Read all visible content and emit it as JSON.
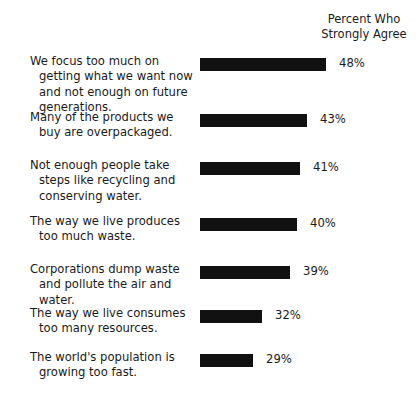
{
  "header": {
    "line1": "Percent Who",
    "line2": "Strongly Agree"
  },
  "chart_data": {
    "type": "bar",
    "orientation": "horizontal",
    "title": "",
    "subtitle": "",
    "xlabel": "",
    "ylabel": "",
    "value_suffix": "%",
    "grid": false,
    "axis_visible": false,
    "legend": "none",
    "bar_color": "#111111",
    "value_header": "Percent Who Strongly Agree",
    "categories": [
      "We focus too much on getting what we want now and not enough on future generations.",
      "Many of the products we buy are overpackaged.",
      "Not enough people take steps like recycling and conserving water.",
      "The way we live produces too much waste.",
      "Corporations dump waste and pollute the air and water.",
      "The way we live consumes too many resources.",
      "The world's population is growing too fast."
    ],
    "values": [
      48,
      43,
      41,
      40,
      39,
      32,
      29
    ],
    "value_labels": [
      "48%",
      "43%",
      "41%",
      "40%",
      "39%",
      "32%",
      "29%"
    ]
  },
  "rows": [
    {
      "lines": [
        "We focus too much on getting",
        "what we want now and not",
        "enough on future generations."
      ],
      "value": 48,
      "value_label": "48%",
      "bar_px": 126,
      "top": 0,
      "height": 56
    },
    {
      "lines": [
        "Many of the products we buy",
        "are overpackaged."
      ],
      "value": 43,
      "value_label": "43%",
      "bar_px": 107,
      "top": 56,
      "height": 48
    },
    {
      "lines": [
        "Not enough people take steps",
        "like recycling and conserving",
        "water."
      ],
      "value": 41,
      "value_label": "41%",
      "bar_px": 100,
      "top": 104,
      "height": 56
    },
    {
      "lines": [
        "The way we live produces too",
        "much waste."
      ],
      "value": 40,
      "value_label": "40%",
      "bar_px": 97,
      "top": 160,
      "height": 48
    },
    {
      "lines": [
        "Corporations dump waste",
        "and pollute the air and water."
      ],
      "value": 39,
      "value_label": "39%",
      "bar_px": 90,
      "top": 208,
      "height": 44
    },
    {
      "lines": [
        "The way we live consumes",
        "too many resources."
      ],
      "value": 32,
      "value_label": "32%",
      "bar_px": 62,
      "top": 252,
      "height": 44
    },
    {
      "lines": [
        "The world's population is",
        "growing too fast."
      ],
      "value": 29,
      "value_label": "29%",
      "bar_px": 53,
      "top": 296,
      "height": 44
    }
  ]
}
